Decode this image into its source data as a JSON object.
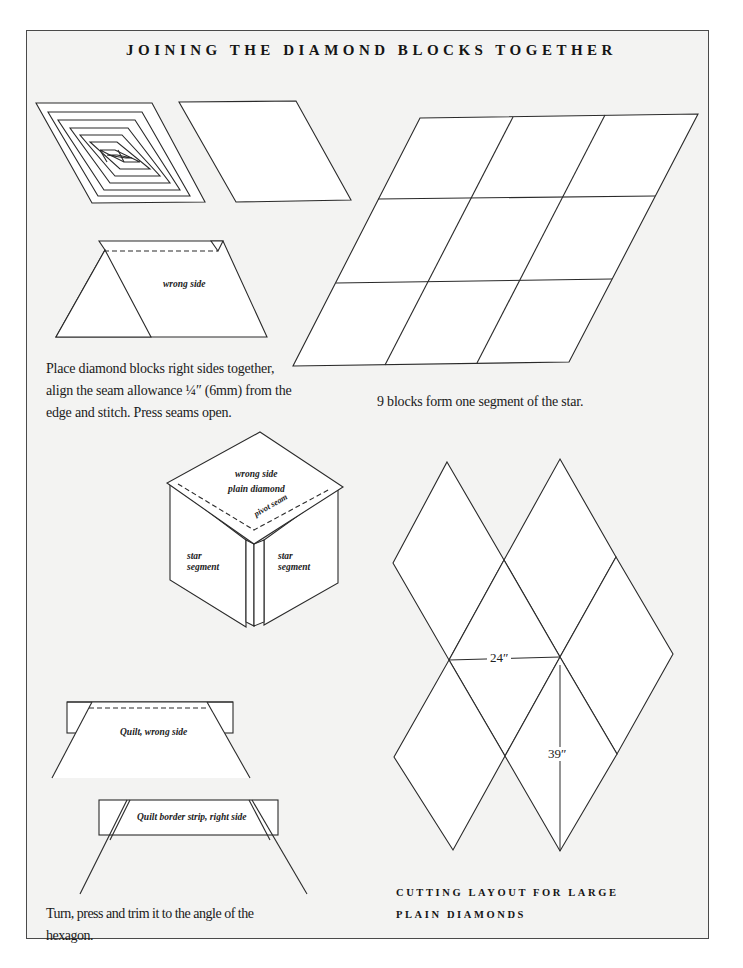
{
  "page": {
    "title": "JOINING THE DIAMOND BLOCKS TOGETHER"
  },
  "figure_1": {
    "labels": {
      "wrong_side": "wrong side"
    },
    "caption": "Place diamond blocks right sides together, align the seam allowance ¼″ (6mm) from the edge and stitch. Press seams open.",
    "caption_lines": [
      "Place diamond blocks right sides together,",
      "align the seam allowance ¼″ (6mm) from the",
      "edge and stitch. Press seams open."
    ]
  },
  "figure_2": {
    "caption": "9 blocks form one segment of the star.",
    "grid": {
      "rows": 3,
      "cols": 3
    }
  },
  "figure_3": {
    "labels": {
      "wrong_side": "wrong side",
      "plain_diamond": "plain diamond",
      "pivot_seam": "pivot seam",
      "star_segment_left_1": "star",
      "star_segment_left_2": "segment",
      "star_segment_right_1": "star",
      "star_segment_right_2": "segment"
    }
  },
  "figure_4": {
    "labels": {
      "quilt_wrong_side": "Quilt, wrong side",
      "border_strip": "Quilt border strip, right side"
    },
    "caption_lines": [
      "Turn, press and trim it to the angle of the",
      "hexagon."
    ]
  },
  "figure_5": {
    "dimensions": {
      "width": "24″",
      "height": "39″"
    },
    "heading_lines": [
      "CUTTING LAYOUT FOR LARGE",
      "PLAIN DIAMONDS"
    ]
  },
  "colors": {
    "page_background": "#f3f3f2",
    "shape_fill": "#ffffff",
    "line": "#2a2a2a",
    "frame_border": "#4a4a4a"
  }
}
